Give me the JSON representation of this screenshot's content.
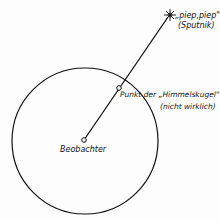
{
  "diagram": {
    "satellite_label": "„piep,piep\"",
    "satellite_sublabel": "(Sputnik)",
    "sphere_point_label": "Punkt der „Himmelskugel\"",
    "sphere_point_sublabel": "(nicht wirklich)",
    "observer_label": "Beobachter"
  }
}
